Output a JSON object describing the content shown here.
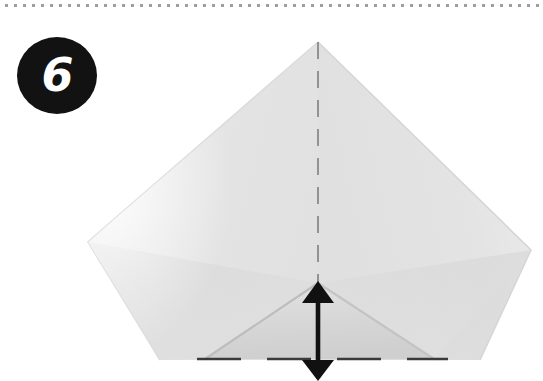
{
  "page": {
    "width": 543,
    "height": 381,
    "background_color": "#ffffff",
    "kind": "origami-instruction-step"
  },
  "separator": {
    "name": "dotted-separator",
    "style": "dotted",
    "color": "#8c8c93",
    "position": "top"
  },
  "step": {
    "number": "6",
    "badge_shape": "circle",
    "badge_color": "#121212",
    "number_color": "#ffffff"
  },
  "diagram": {
    "paper": {
      "fill_color": "#dcdcdc",
      "highlight_color": "#eaeaea",
      "shadow_color": "#c9c9c9",
      "outline_color": "#cfcfcf",
      "shape": "kite-diamond",
      "apex": {
        "x": 318,
        "y": 42
      },
      "left_corner": {
        "x": 88,
        "y": 242
      },
      "right_corner": {
        "x": 531,
        "y": 250
      },
      "bottom_edge_y": 360
    },
    "center_fold_line": {
      "name": "vertical-dashed-fold-line",
      "orientation": "vertical",
      "style": "dashed",
      "color": "#8a8a8a",
      "x": 318,
      "y_start": 42,
      "y_end": 285
    },
    "bottom_fold_line": {
      "name": "horizontal-dashed-fold-line",
      "orientation": "horizontal",
      "style": "dashed",
      "color": "#3a3a3a",
      "y": 359,
      "x_start": 197,
      "x_end": 448
    },
    "center_flap": {
      "name": "center-triangle-flap",
      "apex": {
        "x": 318,
        "y": 283
      },
      "left_base": {
        "x": 205,
        "y": 359
      },
      "right_base": {
        "x": 434,
        "y": 359
      }
    },
    "arrow": {
      "name": "double-headed-fold-arrow",
      "orientation": "vertical",
      "double_headed": true,
      "color": "#111111",
      "x": 318,
      "y_top": 283,
      "y_bottom": 381
    }
  }
}
